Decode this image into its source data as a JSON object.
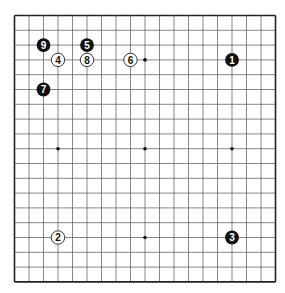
{
  "board": {
    "size": 19,
    "origin_x": 14.5,
    "origin_y": 15.5,
    "spacing_x": 14.5,
    "spacing_y": 14.8,
    "line_color": "#555555",
    "border_color": "#222222",
    "background": "#ffffff",
    "star_points": [
      [
        3,
        3
      ],
      [
        9,
        3
      ],
      [
        15,
        3
      ],
      [
        3,
        9
      ],
      [
        9,
        9
      ],
      [
        15,
        9
      ],
      [
        3,
        15
      ],
      [
        9,
        15
      ],
      [
        15,
        15
      ]
    ]
  },
  "stones": [
    {
      "move": "1",
      "color": "black",
      "col": 15,
      "row": 3
    },
    {
      "move": "2",
      "color": "white",
      "col": 3,
      "row": 15
    },
    {
      "move": "3",
      "color": "black",
      "col": 15,
      "row": 15
    },
    {
      "move": "4",
      "color": "white",
      "col": 3,
      "row": 3
    },
    {
      "move": "5",
      "color": "black",
      "col": 5,
      "row": 2
    },
    {
      "move": "6",
      "color": "white",
      "col": 8,
      "row": 3
    },
    {
      "move": "7",
      "color": "black",
      "col": 2,
      "row": 5
    },
    {
      "move": "8",
      "color": "white",
      "col": 5,
      "row": 3
    },
    {
      "move": "9",
      "color": "black",
      "col": 2,
      "row": 2
    }
  ]
}
